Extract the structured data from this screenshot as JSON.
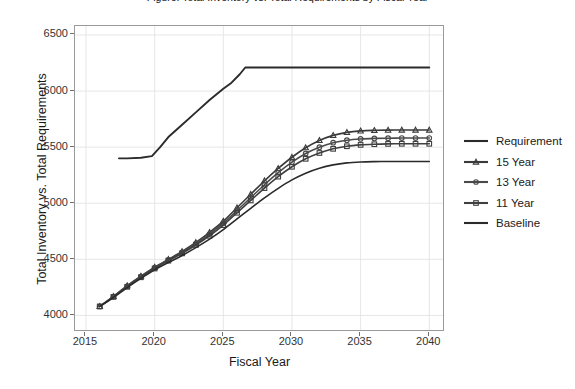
{
  "figure": {
    "cropped_title_fragment": "Figure: Total Inventory vs. Total Requirements by Fiscal Year"
  },
  "axes": {
    "x_label": "Fiscal Year",
    "y_label": "Total Inventory vs. Total Requirements",
    "x_ticks": [
      "2015",
      "2020",
      "2025",
      "2030",
      "2035",
      "2040"
    ],
    "y_ticks": [
      "4000",
      "4500",
      "5000",
      "5500",
      "6000",
      "6500"
    ]
  },
  "legend": {
    "entries": [
      {
        "label": "Requirement",
        "marker": "none",
        "color": "#2b2b2b"
      },
      {
        "label": "15 Year",
        "marker": "triangle",
        "color": "#3a3a3a"
      },
      {
        "label": "13 Year",
        "marker": "circle",
        "color": "#4a4a4a"
      },
      {
        "label": "11 Year",
        "marker": "square",
        "color": "#3f3f3f"
      },
      {
        "label": "Baseline",
        "marker": "none",
        "color": "#2b2b2b"
      }
    ]
  },
  "chart_data": {
    "type": "line",
    "title": "Total Inventory vs. Total Requirements by Fiscal Year",
    "xlabel": "Fiscal Year",
    "ylabel": "Total Inventory vs. Total Requirements",
    "xlim": [
      2014.2,
      2041.0
    ],
    "ylim": [
      3870,
      6580
    ],
    "x_ticks": [
      2015,
      2020,
      2025,
      2030,
      2035,
      2040
    ],
    "y_ticks": [
      4000,
      4500,
      5000,
      5500,
      6000,
      6500
    ],
    "grid": true,
    "legend_position": "right",
    "series": [
      {
        "name": "Requirement",
        "marker": "none",
        "color": "#2b2b2b",
        "x": [
          2017.4,
          2018.0,
          2019.0,
          2019.8,
          2020.4,
          2021.0,
          2022.0,
          2023.0,
          2024.0,
          2025.0,
          2025.6,
          2026.2,
          2026.6,
          2028.0,
          2030.0,
          2032.0,
          2035.0,
          2038.0,
          2040.0
        ],
        "y": [
          5400,
          5400,
          5405,
          5420,
          5500,
          5590,
          5700,
          5810,
          5920,
          6020,
          6075,
          6150,
          6210,
          6210,
          6210,
          6210,
          6210,
          6210,
          6210
        ]
      },
      {
        "name": "15 Year",
        "marker": "triangle",
        "color": "#3a3a3a",
        "x": [
          2016,
          2017,
          2018,
          2019,
          2020,
          2021,
          2022,
          2023,
          2024,
          2025,
          2026,
          2027,
          2028,
          2029,
          2030,
          2031,
          2032,
          2033,
          2034,
          2035,
          2036,
          2037,
          2038,
          2039,
          2040
        ],
        "y": [
          4080,
          4170,
          4265,
          4350,
          4430,
          4500,
          4570,
          4650,
          4740,
          4840,
          4960,
          5080,
          5200,
          5310,
          5410,
          5495,
          5560,
          5605,
          5632,
          5645,
          5650,
          5652,
          5653,
          5653,
          5653
        ]
      },
      {
        "name": "13 Year",
        "marker": "circle",
        "color": "#4a4a4a",
        "x": [
          2016,
          2017,
          2018,
          2019,
          2020,
          2021,
          2022,
          2023,
          2024,
          2025,
          2026,
          2027,
          2028,
          2029,
          2030,
          2031,
          2032,
          2033,
          2034,
          2035,
          2036,
          2037,
          2038,
          2039,
          2040
        ],
        "y": [
          4080,
          4168,
          4260,
          4345,
          4425,
          4495,
          4562,
          4640,
          4725,
          4822,
          4935,
          5050,
          5165,
          5272,
          5366,
          5444,
          5500,
          5540,
          5562,
          5573,
          5578,
          5580,
          5581,
          5581,
          5581
        ]
      },
      {
        "name": "11 Year",
        "marker": "square",
        "color": "#3f3f3f",
        "x": [
          2016,
          2017,
          2018,
          2019,
          2020,
          2021,
          2022,
          2023,
          2024,
          2025,
          2026,
          2027,
          2028,
          2029,
          2030,
          2031,
          2032,
          2033,
          2034,
          2035,
          2036,
          2037,
          2038,
          2039,
          2040
        ],
        "y": [
          4080,
          4165,
          4255,
          4340,
          4418,
          4488,
          4553,
          4628,
          4710,
          4805,
          4915,
          5025,
          5135,
          5237,
          5325,
          5396,
          5448,
          5485,
          5508,
          5520,
          5526,
          5529,
          5530,
          5530,
          5530
        ]
      },
      {
        "name": "Baseline",
        "marker": "none",
        "color": "#2b2b2b",
        "x": [
          2016,
          2017,
          2018,
          2019,
          2020,
          2021,
          2022,
          2023,
          2024,
          2025,
          2026,
          2027,
          2028,
          2029,
          2030,
          2031,
          2032,
          2033,
          2034,
          2035,
          2036,
          2037,
          2038,
          2039,
          2040
        ],
        "y": [
          4080,
          4160,
          4248,
          4330,
          4406,
          4472,
          4534,
          4604,
          4680,
          4765,
          4860,
          4955,
          5048,
          5133,
          5208,
          5268,
          5312,
          5342,
          5360,
          5368,
          5371,
          5372,
          5372,
          5372,
          5372
        ]
      }
    ]
  }
}
